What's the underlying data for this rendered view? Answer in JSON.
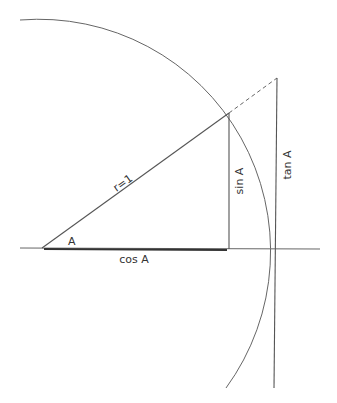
{
  "diagram": {
    "labels": {
      "radius": "r=1",
      "angle": "A",
      "cos": "cos A",
      "sin": "sin A",
      "tan": "tan A"
    },
    "geometry": {
      "origin": [
        42,
        248
      ],
      "radius_px": 232,
      "point_on_circle": [
        229,
        113
      ],
      "tangent_point": [
        276,
        79
      ],
      "axis_x_range": [
        20,
        320
      ]
    },
    "colors": {
      "line": "#555555",
      "heavy_line": "#333333",
      "background": "#ffffff"
    }
  }
}
